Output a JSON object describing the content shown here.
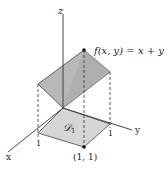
{
  "figure": {
    "axes": {
      "x_label": "x",
      "y_label": "y",
      "z_label": "z"
    },
    "ticks": {
      "x_tick": "1",
      "y_tick": "1"
    },
    "function_label": "f(x, y) = x + y",
    "region_label": "𝒟",
    "region_subscript": "1",
    "point_label": "(1, 1)",
    "colors": {
      "surface_fill": "#b8b8b8",
      "region_fill": "#d6d6d6",
      "stroke": "#333333"
    }
  }
}
